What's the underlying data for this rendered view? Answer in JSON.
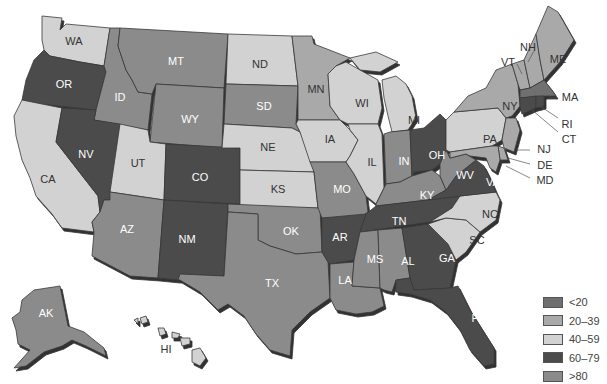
{
  "map": {
    "colors": {
      "lt20": "#6f6f6f",
      "r20_39": "#a9a9a9",
      "r40_59": "#d2d2d2",
      "r60_79": "#4b4b4b",
      "gt80": "#8b8b8b"
    },
    "states": {
      "WA": {
        "label": "WA",
        "cat": "r40_59"
      },
      "OR": {
        "label": "OR",
        "cat": "r60_79"
      },
      "CA": {
        "label": "CA",
        "cat": "r40_59"
      },
      "ID": {
        "label": "ID",
        "cat": "gt80"
      },
      "NV": {
        "label": "NV",
        "cat": "r60_79"
      },
      "MT": {
        "label": "MT",
        "cat": "gt80"
      },
      "WY": {
        "label": "WY",
        "cat": "gt80"
      },
      "UT": {
        "label": "UT",
        "cat": "r40_59"
      },
      "AZ": {
        "label": "AZ",
        "cat": "gt80"
      },
      "CO": {
        "label": "CO",
        "cat": "r60_79"
      },
      "NM": {
        "label": "NM",
        "cat": "r60_79"
      },
      "ND": {
        "label": "ND",
        "cat": "r40_59"
      },
      "SD": {
        "label": "SD",
        "cat": "gt80"
      },
      "NE": {
        "label": "NE",
        "cat": "r40_59"
      },
      "KS": {
        "label": "KS",
        "cat": "r40_59"
      },
      "OK": {
        "label": "OK",
        "cat": "gt80"
      },
      "TX": {
        "label": "TX",
        "cat": "gt80"
      },
      "MN": {
        "label": "MN",
        "cat": "r20_39"
      },
      "IA": {
        "label": "IA",
        "cat": "r40_59"
      },
      "MO": {
        "label": "MO",
        "cat": "gt80"
      },
      "AR": {
        "label": "AR",
        "cat": "r60_79"
      },
      "LA": {
        "label": "LA",
        "cat": "gt80"
      },
      "WI": {
        "label": "WI",
        "cat": "r40_59"
      },
      "IL": {
        "label": "IL",
        "cat": "r40_59"
      },
      "MI": {
        "label": "MI",
        "cat": "r40_59"
      },
      "IN": {
        "label": "IN",
        "cat": "gt80"
      },
      "OH": {
        "label": "OH",
        "cat": "r60_79"
      },
      "KY": {
        "label": "KY",
        "cat": "gt80"
      },
      "TN": {
        "label": "TN",
        "cat": "r60_79"
      },
      "MS": {
        "label": "MS",
        "cat": "gt80"
      },
      "AL": {
        "label": "AL",
        "cat": "gt80"
      },
      "GA": {
        "label": "GA",
        "cat": "r60_79"
      },
      "FL": {
        "label": "FL",
        "cat": "r60_79"
      },
      "SC": {
        "label": "SC",
        "cat": "r40_59"
      },
      "NC": {
        "label": "NC",
        "cat": "r40_59"
      },
      "VA": {
        "label": "VA",
        "cat": "r60_79"
      },
      "WV": {
        "label": "WV",
        "cat": "gt80"
      },
      "PA": {
        "label": "PA",
        "cat": "r40_59"
      },
      "NY": {
        "label": "NY",
        "cat": "r20_39"
      },
      "VT": {
        "label": "VT",
        "cat": "r20_39"
      },
      "NH": {
        "label": "NH",
        "cat": "r20_39"
      },
      "ME": {
        "label": "ME",
        "cat": "r20_39"
      },
      "MA": {
        "label": "MA",
        "cat": "lt20"
      },
      "RI": {
        "label": "RI",
        "cat": "r60_79"
      },
      "CT": {
        "label": "CT",
        "cat": "r60_79"
      },
      "NJ": {
        "label": "NJ",
        "cat": "r20_39"
      },
      "DE": {
        "label": "DE",
        "cat": "r20_39"
      },
      "MD": {
        "label": "MD",
        "cat": "r20_39"
      },
      "AK": {
        "label": "AK",
        "cat": "gt80"
      },
      "HI": {
        "label": "HI",
        "cat": "r40_59"
      }
    }
  },
  "legend": {
    "items": [
      {
        "label": "<20",
        "color": "#6f6f6f"
      },
      {
        "label": "20–39",
        "color": "#a9a9a9"
      },
      {
        "label": "40–59",
        "color": "#d2d2d2"
      },
      {
        "label": "60–79",
        "color": "#4b4b4b"
      },
      {
        "label": ">80",
        "color": "#8b8b8b"
      }
    ]
  }
}
